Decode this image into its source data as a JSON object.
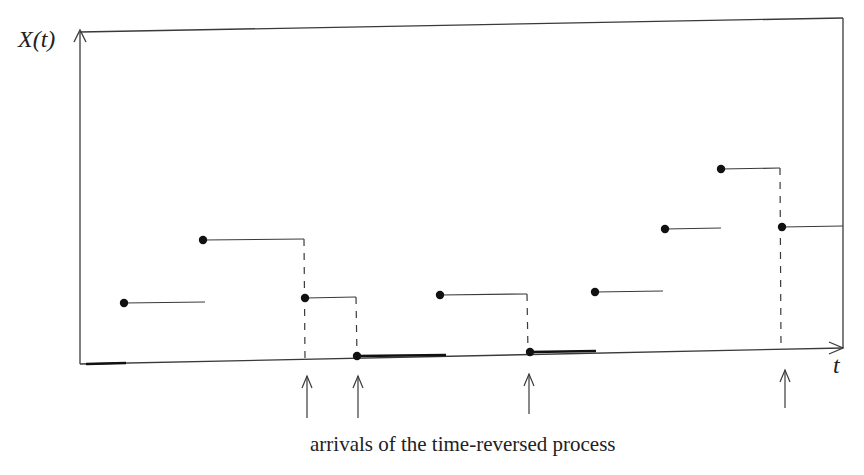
{
  "labels": {
    "y_axis": "X(t)",
    "x_axis": "t",
    "caption": "arrivals of the time-reversed process"
  },
  "colors": {
    "line": "#3a3a3a",
    "dot": "#111111",
    "text": "#222222",
    "background": "#ffffff"
  },
  "frame": {
    "x1": 80,
    "y1": 32,
    "x2": 843,
    "y2": 18,
    "bottom_left_y": 364,
    "bottom_right_y": 348
  },
  "steps": [
    {
      "x_start": 124,
      "x_end": 205,
      "y": 303,
      "dashed_drop": false
    },
    {
      "x_start": 203,
      "x_end": 304,
      "y": 240,
      "dashed_drop": true,
      "drop_to_y": 358
    },
    {
      "x_start": 305,
      "x_end": 356,
      "y": 298,
      "dashed_drop": true,
      "drop_to_y": 356
    },
    {
      "x_start": 440,
      "x_end": 527,
      "y": 295,
      "dashed_drop": true,
      "drop_to_y": 352
    },
    {
      "x_start": 595,
      "x_end": 663,
      "y": 292,
      "dashed_drop": false
    },
    {
      "x_start": 665,
      "x_end": 721,
      "y": 229,
      "dashed_drop": false
    },
    {
      "x_start": 721,
      "x_end": 780,
      "y": 169,
      "dashed_drop": true,
      "drop_to_y": 346
    },
    {
      "x_start": 782,
      "x_end": 843,
      "y": 227,
      "dashed_drop": false
    }
  ],
  "axis_dots": [
    {
      "x": 357,
      "y": 356
    },
    {
      "x": 530,
      "y": 352
    }
  ],
  "bold_axis_segments": [
    {
      "x1": 86,
      "y1": 364,
      "x2": 126,
      "y2": 363
    },
    {
      "x1": 357,
      "y1": 356,
      "x2": 446,
      "y2": 355
    },
    {
      "x1": 530,
      "y1": 352,
      "x2": 596,
      "y2": 351
    }
  ],
  "arrivals": [
    {
      "x": 307,
      "y_top": 376,
      "y_bottom": 418
    },
    {
      "x": 358,
      "y_top": 376,
      "y_bottom": 418
    },
    {
      "x": 529,
      "y_top": 374,
      "y_bottom": 414
    },
    {
      "x": 785,
      "y_top": 370,
      "y_bottom": 408
    }
  ]
}
